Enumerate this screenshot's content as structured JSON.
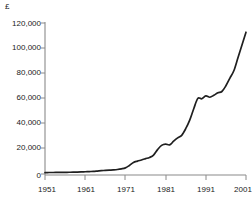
{
  "chart_data": {
    "type": "line",
    "title": "",
    "subtitle": "",
    "xlabel": "",
    "ylabel": "",
    "currency_symbol": "£",
    "xlim": [
      1951,
      2001
    ],
    "ylim": [
      0,
      120000
    ],
    "grid": false,
    "legend": false,
    "y_tick_labels": [
      "0",
      "20,000",
      "40,000",
      "60,000",
      "80,000",
      "100,000",
      "120,000"
    ],
    "y_tick_values": [
      0,
      20000,
      40000,
      60000,
      80000,
      100000,
      120000
    ],
    "x_tick_labels": [
      "1951",
      "1961",
      "1971",
      "1981",
      "1991",
      "2001"
    ],
    "x_tick_values": [
      1951,
      1961,
      1971,
      1981,
      1991,
      2001
    ],
    "series": [
      {
        "name": "Average house price",
        "color": "#1f1f1f",
        "x": [
          1951,
          1952,
          1953,
          1954,
          1955,
          1956,
          1957,
          1958,
          1959,
          1960,
          1961,
          1962,
          1963,
          1964,
          1965,
          1966,
          1967,
          1968,
          1969,
          1970,
          1971,
          1972,
          1973,
          1974,
          1975,
          1976,
          1977,
          1978,
          1979,
          1980,
          1981,
          1982,
          1983,
          1984,
          1985,
          1986,
          1987,
          1988,
          1989,
          1990,
          1991,
          1992,
          1993,
          1994,
          1995,
          1996,
          1997,
          1998,
          1999,
          2000,
          2001
        ],
        "values": [
          1900,
          1950,
          1980,
          2000,
          2050,
          2100,
          2150,
          2200,
          2300,
          2400,
          2550,
          2700,
          2850,
          3100,
          3400,
          3600,
          3800,
          4000,
          4300,
          4800,
          5600,
          7500,
          9800,
          10900,
          11800,
          12800,
          13800,
          15600,
          19900,
          23200,
          24200,
          23600,
          26500,
          29100,
          31100,
          36300,
          43000,
          52000,
          60000,
          59800,
          62000,
          61000,
          62500,
          64500,
          65500,
          70000,
          76000,
          82000,
          92000,
          102000,
          112000
        ]
      }
    ]
  },
  "axes": {
    "y_axis_name": "value-axis",
    "x_axis_name": "year-axis"
  }
}
